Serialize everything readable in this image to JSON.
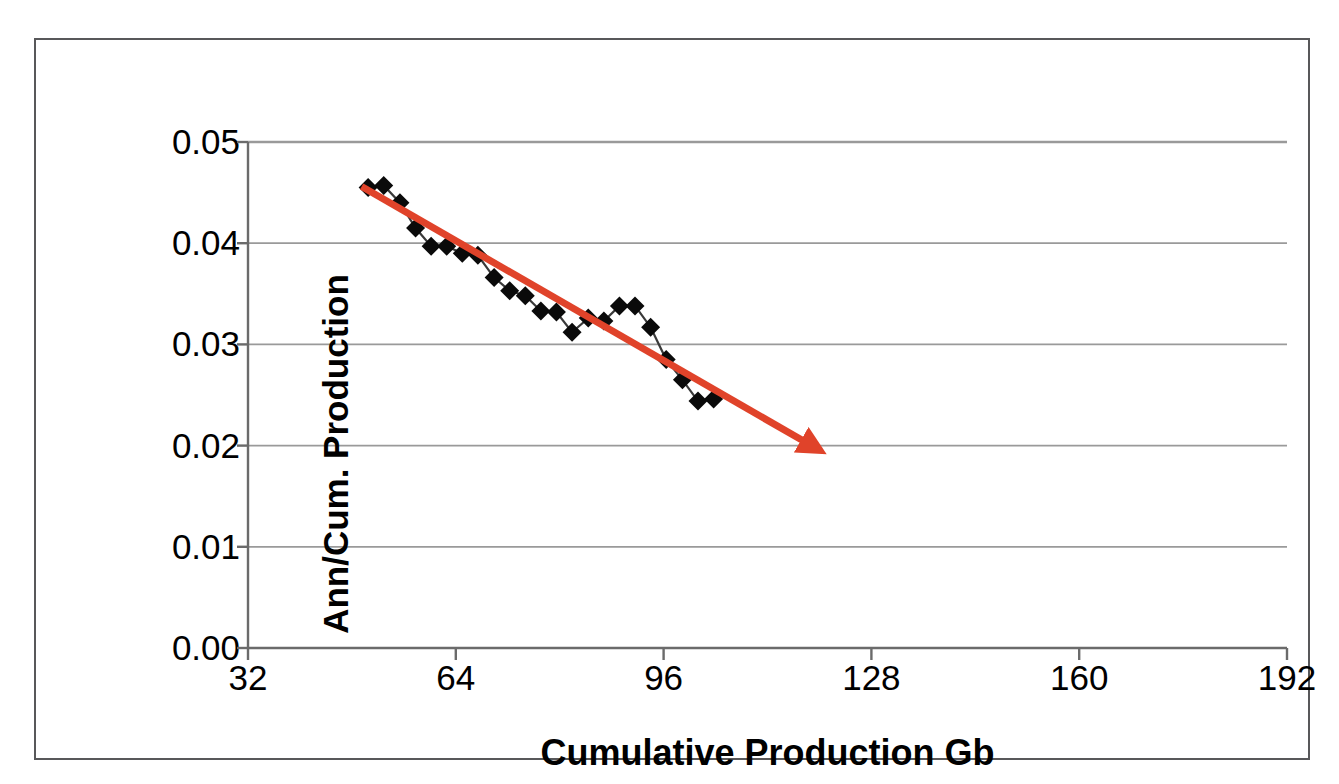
{
  "chart_data": {
    "type": "line",
    "title": "",
    "subtitle": "",
    "xlabel": "Cumulative Production Gb",
    "ylabel": "Ann/Cum. Production",
    "xlim": [
      32,
      192
    ],
    "ylim": [
      0.0,
      0.05
    ],
    "xticks": [
      "32",
      "64",
      "96",
      "128",
      "160",
      "192"
    ],
    "xtick_values": [
      32,
      64,
      96,
      128,
      160,
      192
    ],
    "yticks": [
      "0.00",
      "0.01",
      "0.02",
      "0.03",
      "0.04",
      "0.05"
    ],
    "ytick_values": [
      0.0,
      0.01,
      0.02,
      0.03,
      0.04,
      0.05
    ],
    "grid": "horizontal",
    "legend": "none",
    "series": [
      {
        "name": "Ann/Cum. Production",
        "marker": "diamond",
        "marker_color": "#0a0a0a",
        "line_color": "#3a3a3a",
        "x": [
          50.5,
          52.9,
          55.4,
          57.8,
          60.2,
          62.6,
          65.0,
          67.4,
          69.9,
          72.3,
          74.7,
          77.1,
          79.5,
          81.9,
          84.4,
          86.8,
          89.2,
          91.6,
          94.0,
          96.4,
          98.9,
          101.3,
          103.7
        ],
        "y": [
          0.0455,
          0.0457,
          0.044,
          0.0415,
          0.0397,
          0.0397,
          0.039,
          0.0388,
          0.0366,
          0.0353,
          0.0348,
          0.0333,
          0.0332,
          0.0312,
          0.0326,
          0.0323,
          0.0338,
          0.0338,
          0.0317,
          0.0285,
          0.0265,
          0.0244,
          0.0246
        ]
      }
    ],
    "annotations": [
      {
        "name": "trend-arrow",
        "type": "arrow",
        "color": "#e0432a",
        "x_start": 49.5,
        "y_start": 0.0456,
        "x_end": 118.5,
        "y_end": 0.0201,
        "width_px": 7
      }
    ]
  },
  "axes": {
    "y_title": "Ann/Cum. Production",
    "x_title": "Cumulative Production Gb"
  },
  "colors": {
    "frame": "#58585a",
    "gridline": "#9a9a9a",
    "axis": "#6b6b6b",
    "trend": "#e0432a",
    "marker": "#0a0a0a",
    "series_line": "#3a3a3a",
    "background": "#ffffff"
  }
}
